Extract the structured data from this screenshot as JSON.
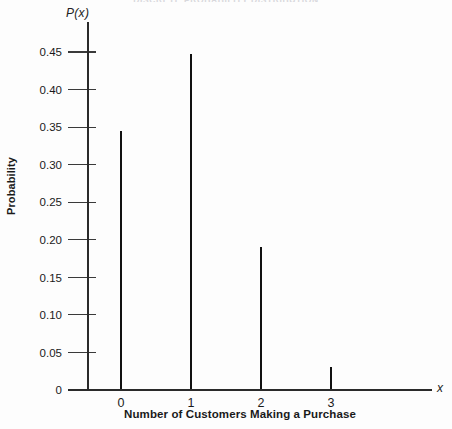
{
  "chart_data": {
    "type": "bar",
    "title": "DISCRETE  PROBABILITY  DISTRIBUTION",
    "subtitle": "",
    "xlabel": "Number of Customers Making a Purchase",
    "ylabel": "Probability",
    "x_axis_variable": "x",
    "y_axis_function": "P(x)",
    "categories": [
      "0",
      "1",
      "2",
      "3"
    ],
    "values": [
      0.345,
      0.448,
      0.19,
      0.03
    ],
    "xlim": [
      -0.55,
      3.9
    ],
    "ylim": [
      0,
      0.47
    ],
    "ytick_labels": [
      "0",
      "0.05",
      "0.10",
      "0.15",
      "0.20",
      "0.25",
      "0.30",
      "0.35",
      "0.40",
      "0.45"
    ],
    "ytick_values": [
      0,
      0.05,
      0.1,
      0.15,
      0.2,
      0.25,
      0.3,
      0.35,
      0.4,
      0.45
    ],
    "xtick_labels": [
      "0",
      "1",
      "2",
      "3"
    ],
    "xtick_values": [
      0,
      1,
      2,
      3
    ],
    "grid": false,
    "legend": false,
    "legend_position": "none",
    "series_color": "#111111",
    "axis_color": "#2a2a2a",
    "background_color": "#fdfdfd"
  }
}
